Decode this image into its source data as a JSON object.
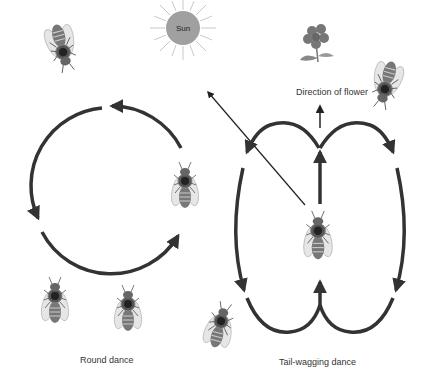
{
  "labels": {
    "sun": "Sun",
    "flower_direction": "Direction of flower",
    "round_dance": "Round dance",
    "tail_wagging_dance": "Tail-wagging dance"
  },
  "colors": {
    "path": "#333333",
    "sun_fill": "#a0a0a0",
    "sun_rays": "#bbbbbb",
    "flower": "#777777",
    "background": "#ffffff"
  },
  "elements": {
    "bees": [
      {
        "id": "bee-top-left",
        "rotation": 160
      },
      {
        "id": "bee-top-right",
        "rotation": 200
      },
      {
        "id": "bee-round-right",
        "rotation": 0
      },
      {
        "id": "bee-bottom-1",
        "rotation": 0
      },
      {
        "id": "bee-bottom-2",
        "rotation": 0
      },
      {
        "id": "bee-waggle-center",
        "rotation": 0
      },
      {
        "id": "bee-waggle-left",
        "rotation": 20
      }
    ]
  }
}
